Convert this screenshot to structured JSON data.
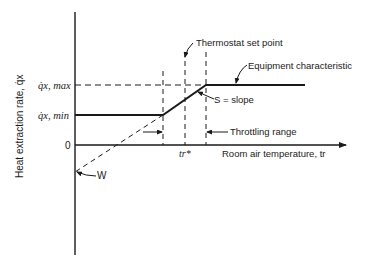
{
  "diagram": {
    "type": "control-characteristic",
    "y_axis_label": "Heat extraction rate, q̇x",
    "x_axis_label": "Room air temperature, tr",
    "y_ticks": {
      "q_max": "q̇x, max",
      "q_min": "q̇x, min",
      "zero": "0"
    },
    "x_ticks": {
      "setpoint": "tr*"
    },
    "annotations": {
      "thermostat": "Thermostat set point",
      "equipment": "Equipment characteristic",
      "slope": "S = slope",
      "throttling": "Throttling range",
      "intercept": "W"
    },
    "colors": {
      "line": "#1a1a1a",
      "background": "#ffffff"
    }
  }
}
